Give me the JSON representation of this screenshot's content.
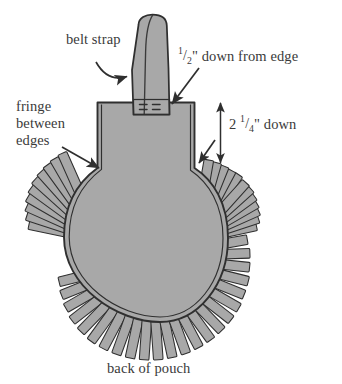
{
  "figure": {
    "title": "back of pouch",
    "background_color": "#ffffff",
    "leather_fill_color": "#a8a8a8",
    "outline_color": "#2f2f2f",
    "label_color": "#3a3a3a",
    "canvas": {
      "width": 342,
      "height": 384
    }
  },
  "labels": {
    "belt_strap": "belt strap",
    "half_inch_down": {
      "numerator": "1",
      "slash": "/",
      "denominator": "2",
      "suffix": "\" down from edge",
      "full_text": "1/2\" down from edge"
    },
    "fringe_between_edges": {
      "line1": "fringe",
      "line2": "between",
      "line3": "edges",
      "full_text": "fringe between edges"
    },
    "two_and_quarter_down": {
      "whole": "2",
      "numerator": "1",
      "slash": "/",
      "denominator": "4",
      "suffix": "\" down",
      "full_text": "2 1/4\" down"
    },
    "caption": "back of pouch"
  },
  "parts": {
    "pouch_body": "pouch-body",
    "belt_strap": "belt-strap",
    "strap_fold_line": "strap-fold-line",
    "strap_stitch_marks": "strap-stitch-marks",
    "fringe_strips": "fringe-strips",
    "inner_stitch_line": "inner-stitch-line"
  },
  "annotations": {
    "belt_strap_arrow": "curved-arrow-icon",
    "half_inch_arrow": "arrow-icon",
    "fringe_arrow": "arrow-icon",
    "measure_arrow": "double-headed-arrow-icon"
  },
  "measurements": {
    "strap_placement_from_edge": "1/2\"",
    "fringe_start_depth": "2 1/4\""
  }
}
